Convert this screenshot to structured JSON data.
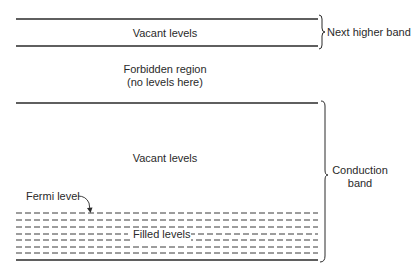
{
  "diagram": {
    "upper_band": {
      "label": "Vacant levels",
      "brace_label": "Next higher band"
    },
    "gap": {
      "line1": "Forbidden region",
      "line2": "(no levels here)"
    },
    "conduction_band": {
      "vacant_label": "Vacant levels",
      "brace_label_line1": "Conduction",
      "brace_label_line2": "band",
      "fermi_label": "Fermi level",
      "filled_label": "Filled levels",
      "filled_dashed_line_count": 7
    },
    "colors": {
      "line": "#2a2a2a",
      "background": "#ffffff"
    }
  }
}
